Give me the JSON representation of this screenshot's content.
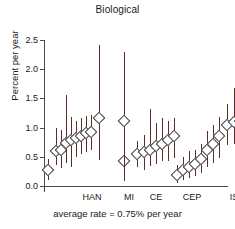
{
  "chart_data": {
    "type": "scatter",
    "title": "Biological",
    "xlabel": "",
    "ylabel": "Percent per year",
    "ylim": [
      0.0,
      2.5
    ],
    "yticks": [
      "0.0",
      "0.5",
      "1.0",
      "1.5",
      "2.0",
      "2.5"
    ],
    "ytick_values": [
      0.0,
      0.5,
      1.0,
      1.5,
      2.0,
      2.5
    ],
    "grid": false,
    "legend": "none",
    "marker": "open-diamond",
    "errorbar_style": "vertical-line",
    "annotation": "average rate = 0.75% per year",
    "categories": [
      "HAN",
      "MI",
      "CE",
      "CEP",
      "IS",
      "HG"
    ],
    "groups": [
      {
        "name": "HAN",
        "label_x": 48,
        "points": [
          {
            "x": 4,
            "value": 0.28,
            "low": 0.1,
            "high": 0.46
          },
          {
            "x": 12,
            "value": 0.6,
            "low": 0.36,
            "high": 1.0
          },
          {
            "x": 17,
            "value": 0.62,
            "low": 0.3,
            "high": 0.96
          },
          {
            "x": 22,
            "value": 0.74,
            "low": 0.4,
            "high": 1.55
          },
          {
            "x": 27,
            "value": 0.78,
            "low": 0.33,
            "high": 1.18
          },
          {
            "x": 32,
            "value": 0.82,
            "low": 0.5,
            "high": 1.12
          },
          {
            "x": 37,
            "value": 0.86,
            "low": 0.55,
            "high": 1.17
          },
          {
            "x": 42,
            "value": 0.9,
            "low": 0.58,
            "high": 1.2
          },
          {
            "x": 47,
            "value": 0.93,
            "low": 0.62,
            "high": 1.22
          },
          {
            "x": 55,
            "value": 1.17,
            "low": 0.44,
            "high": 2.41
          }
        ]
      },
      {
        "name": "MI",
        "label_x": 85,
        "points": [
          {
            "x": 80,
            "value": 0.43,
            "low": 0.09,
            "high": 0.78
          },
          {
            "x": 80,
            "value": 1.11,
            "low": 0.09,
            "high": 2.3
          }
        ]
      },
      {
        "name": "CE",
        "label_x": 112,
        "points": [
          {
            "x": 93,
            "value": 0.55,
            "low": 0.33,
            "high": 0.77
          },
          {
            "x": 100,
            "value": 0.58,
            "low": 0.28,
            "high": 0.88
          },
          {
            "x": 106,
            "value": 0.62,
            "low": 0.34,
            "high": 1.31
          },
          {
            "x": 112,
            "value": 0.68,
            "low": 0.37,
            "high": 1.08
          },
          {
            "x": 118,
            "value": 0.72,
            "low": 0.42,
            "high": 1.16
          },
          {
            "x": 124,
            "value": 0.78,
            "low": 0.43,
            "high": 1.12
          },
          {
            "x": 130,
            "value": 0.86,
            "low": 0.48,
            "high": 1.17
          }
        ]
      },
      {
        "name": "CEP",
        "label_x": 148,
        "points": [
          {
            "x": 133,
            "value": 0.18,
            "low": 0.05,
            "high": 0.36
          },
          {
            "x": 139,
            "value": 0.27,
            "low": 0.1,
            "high": 0.5
          },
          {
            "x": 145,
            "value": 0.33,
            "low": 0.14,
            "high": 0.6
          },
          {
            "x": 151,
            "value": 0.38,
            "low": 0.17,
            "high": 0.62
          },
          {
            "x": 157,
            "value": 0.46,
            "low": 0.23,
            "high": 0.72
          },
          {
            "x": 163,
            "value": 0.62,
            "low": 0.32,
            "high": 0.95
          },
          {
            "x": 169,
            "value": 0.72,
            "low": 0.4,
            "high": 1.05
          },
          {
            "x": 175,
            "value": 0.85,
            "low": 0.48,
            "high": 1.18
          }
        ]
      },
      {
        "name": "IS",
        "label_x": 190,
        "points": [
          {
            "x": 183,
            "value": 1.05,
            "low": 0.7,
            "high": 1.41
          },
          {
            "x": 190,
            "value": 1.09,
            "low": 0.72,
            "high": 1.68
          },
          {
            "x": 196,
            "value": 1.11,
            "low": 0.84,
            "high": 1.48
          }
        ]
      },
      {
        "name": "HG",
        "label_x": 215,
        "points": [
          {
            "x": 206,
            "value": 0.38,
            "low": 0.25,
            "high": 0.58
          },
          {
            "x": 212,
            "value": 0.44,
            "low": 0.14,
            "high": 0.74
          },
          {
            "x": 219,
            "value": 0.75,
            "low": 0.53,
            "high": 1.07
          },
          {
            "x": 226,
            "value": 1.01,
            "low": 0.56,
            "high": 1.66
          }
        ]
      }
    ]
  },
  "colors": {
    "errorbar": "#5a2d2d",
    "marker_edge": "#3a3a3a",
    "marker_fill": "#ffffff",
    "axis": "#4a4a4a",
    "text": "#1a1a1a",
    "background": "#ffffff"
  }
}
